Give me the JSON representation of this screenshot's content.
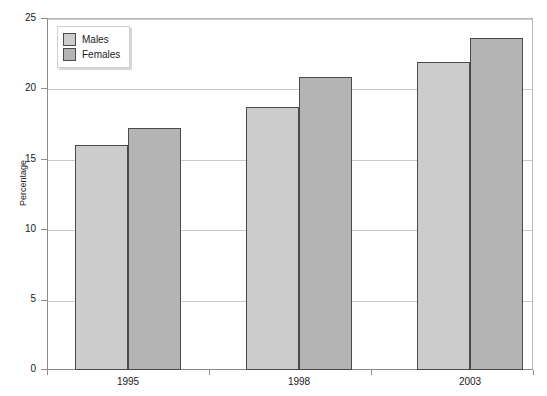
{
  "chart_data": {
    "type": "bar",
    "title": "",
    "xlabel": "",
    "ylabel": "Percentage",
    "categories": [
      "1995",
      "1998",
      "2003"
    ],
    "series": [
      {
        "name": "Males",
        "color": "#cccccc",
        "values": [
          16.0,
          18.7,
          21.9
        ]
      },
      {
        "name": "Females",
        "color": "#b4b4b4",
        "values": [
          17.2,
          20.8,
          23.6
        ]
      }
    ],
    "ylim": [
      0,
      25
    ],
    "yticks": [
      "0",
      "5",
      "10",
      "15",
      "20",
      "25"
    ],
    "ytick_values": [
      0,
      5,
      10,
      15,
      20,
      25
    ],
    "grid": "horizontal",
    "legend_position": "top-left",
    "legend_entries": [
      "Males",
      "Females"
    ],
    "bar_border_color": "#4a4a4a",
    "axis_color": "#8c8c8c",
    "gridline_color": "#c9c9c9",
    "background": "#ffffff"
  }
}
